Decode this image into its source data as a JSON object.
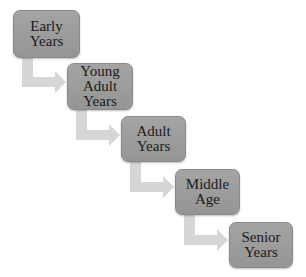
{
  "diagram": {
    "type": "step-down process",
    "colors": {
      "box_fill": "#9c9c9c",
      "box_border": "#8a8a8a",
      "arrow": "#d6d6d6",
      "text": "#1a1a1a"
    },
    "stages": [
      {
        "label": "Early\nYears"
      },
      {
        "label": "Young\nAdult\nYears"
      },
      {
        "label": "Adult\nYears"
      },
      {
        "label": "Middle\nAge"
      },
      {
        "label": "Senior\nYears"
      }
    ]
  }
}
